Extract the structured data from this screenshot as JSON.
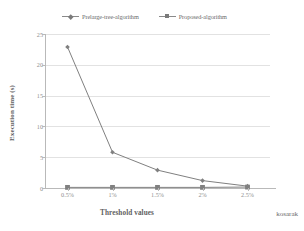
{
  "chart_data": {
    "type": "line",
    "title": "",
    "xlabel": "Threshold values",
    "ylabel": "Execution time (s)",
    "dataset_label": "kosarak",
    "categories": [
      "0.5%",
      "1%",
      "1.5%",
      "2%",
      "2.5%"
    ],
    "yticks": [
      "0",
      "5",
      "10",
      "15",
      "20",
      "25"
    ],
    "ylim": [
      0,
      25
    ],
    "grid": true,
    "legend_position": "top",
    "series": [
      {
        "name": "Prelarge-tree-algorithm",
        "marker": "diamond",
        "color": "#808080",
        "values": [
          22.9,
          5.8,
          2.9,
          1.2,
          0.3
        ]
      },
      {
        "name": "Proposed-algorithm",
        "marker": "square",
        "color": "#808080",
        "values": [
          0.1,
          0.1,
          0.1,
          0.1,
          0.15
        ]
      }
    ]
  },
  "legend": {
    "items": [
      {
        "label": "Prelarge-tree-algorithm"
      },
      {
        "label": "Proposed-algorithm"
      }
    ]
  },
  "colors": {
    "line": "#808080",
    "grid": "#e2e2e2",
    "axis": "#b9b9b9",
    "text": "#6b6b6b"
  }
}
